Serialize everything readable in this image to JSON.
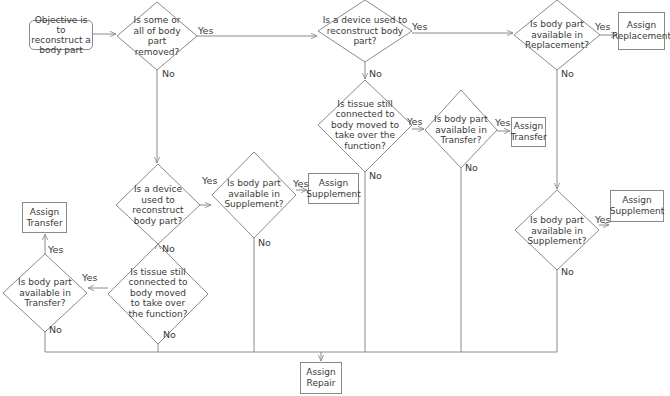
{
  "start": {
    "label": "Objective is to reconstruct a body part"
  },
  "decisions": {
    "removed": {
      "label": "Is some or all of body part removed?"
    },
    "device_top": {
      "label": "Is a device used to reconstruct body part?"
    },
    "replacement": {
      "label": "Is body part available in Replacement?"
    },
    "tissue_top": {
      "label": "Is tissue still connected to body moved to take over the function?"
    },
    "transfer_top": {
      "label": "Is body part available in Transfer?"
    },
    "device_mid": {
      "label": "Is a device used to reconstruct body part?"
    },
    "supplement_mid": {
      "label": "Is body part available in Supplement?"
    },
    "supplement_right": {
      "label": "Is body part available in Supplement?"
    },
    "tissue_bottom": {
      "label": "Is tissue still connected to body moved to take over the function?"
    },
    "transfer_left": {
      "label": "Is body part available in Transfer?"
    }
  },
  "outcomes": {
    "replacement": {
      "label": "Assign Replacement"
    },
    "transfer_top": {
      "label": "Assign Transfer"
    },
    "supplement_mid": {
      "label": "Assign Supplement"
    },
    "supplement_right": {
      "label": "Assign Supplement"
    },
    "transfer_left": {
      "label": "Assign Transfer"
    },
    "repair": {
      "label": "Assign Repair"
    }
  },
  "edge_labels": {
    "yes": "Yes",
    "no": "No"
  },
  "colors": {
    "line": "#8a8a8a",
    "text": "#3a3a3a",
    "background": "#ffffff"
  }
}
